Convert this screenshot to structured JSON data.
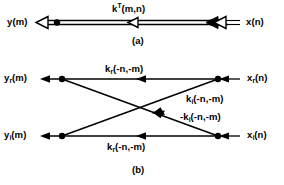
{
  "figure": {
    "ink_color": "#000000",
    "background_color": "#ffffff",
    "panels": [
      {
        "id": "a",
        "caption": "(a)",
        "left_label": "y(m)",
        "right_label": "x(n)",
        "branch_label_base": "k",
        "branch_label_sup": "T",
        "branch_label_args": "(m,n)",
        "branch_label_full": "k^T(m,n)",
        "direction": "right-to-left"
      },
      {
        "id": "b",
        "caption": "(b)",
        "nodes": [
          {
            "name": "y_r(m)",
            "base": "y",
            "sub": "r",
            "args": "(m)",
            "position": "top-left-output"
          },
          {
            "name": "x_r(n)",
            "base": "x",
            "sub": "r",
            "args": "(n)",
            "position": "top-right-input"
          },
          {
            "name": "y_i(m)",
            "base": "y",
            "sub": "i",
            "args": "(m)",
            "position": "bottom-left-output"
          },
          {
            "name": "x_i(n)",
            "base": "x",
            "sub": "i",
            "args": "(n)",
            "position": "bottom-right-input"
          }
        ],
        "branches": [
          {
            "id": "top-horizontal",
            "from": "x_r(n)",
            "to": "y_r(m)",
            "label_full": "k_r(-n,-m)",
            "base": "k",
            "sub": "r",
            "args": "(-n,-m)",
            "sign": ""
          },
          {
            "id": "diagonal-upper",
            "from": "x_i(n)",
            "to": "y_r(m)",
            "label_full": "k_i(-n,-m)",
            "base": "k",
            "sub": "i",
            "args": "(-n,-m)",
            "sign": ""
          },
          {
            "id": "diagonal-lower",
            "from": "x_r(n)",
            "to": "y_i(m)",
            "label_full": "-k_i(-n,-m)",
            "base": "k",
            "sub": "i",
            "args": "(-n,-m)",
            "sign": "-"
          },
          {
            "id": "bottom-horizontal",
            "from": "x_i(n)",
            "to": "y_i(m)",
            "label_full": "k_r(-n,-m)",
            "base": "k",
            "sub": "r",
            "args": "(-n,-m)",
            "sign": ""
          }
        ]
      }
    ]
  }
}
